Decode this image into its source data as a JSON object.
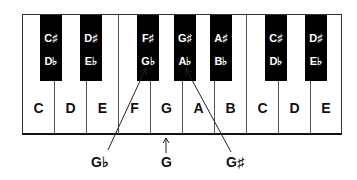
{
  "white_keys": [
    "C",
    "D",
    "E",
    "F",
    "G",
    "A",
    "B",
    "C",
    "D",
    "E"
  ],
  "black_keys": [
    {
      "sharp": "C♯",
      "flat": "D♭"
    },
    {
      "sharp": "D♯",
      "flat": "E♭"
    },
    {
      "sharp": "F♯",
      "flat": "G♭"
    },
    {
      "sharp": "G♯",
      "flat": "A♭"
    },
    {
      "sharp": "A♯",
      "flat": "B♭"
    },
    {
      "sharp": "C♯",
      "flat": "D♭"
    },
    {
      "sharp": "D♯",
      "flat": "E♭"
    }
  ],
  "callouts": {
    "g_flat": "G♭",
    "g_natural": "G",
    "g_sharp": "G♯"
  },
  "colors": {
    "black_key": "#000000",
    "white_key": "#ffffff",
    "line": "#333333"
  }
}
